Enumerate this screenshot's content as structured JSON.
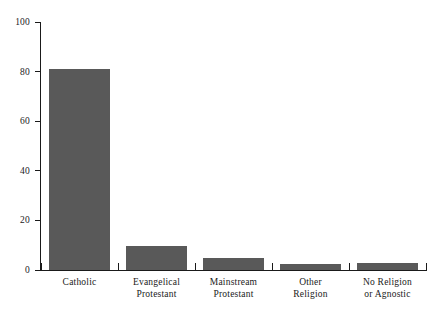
{
  "chart_data": {
    "type": "bar",
    "title": "",
    "subtitle": "",
    "xlabel": "",
    "ylabel": "",
    "ylim": [
      0,
      100
    ],
    "yticks": [
      0,
      20,
      40,
      60,
      80,
      100
    ],
    "grid": false,
    "legend": null,
    "bar_color": "#595959",
    "axis_color": "#1a1a1a",
    "background": "#ffffff",
    "categories": [
      "Catholic",
      "Evangelical Protestant",
      "Mainstream Protestant",
      "Other Religion",
      "No Religion or Agnostic"
    ],
    "category_lines": [
      [
        "Catholic",
        ""
      ],
      [
        "Evangelical",
        "Protestant"
      ],
      [
        "Mainstream",
        "Protestant"
      ],
      [
        "Other",
        "Religion"
      ],
      [
        "No Religion",
        "or Agnostic"
      ]
    ],
    "values": [
      81,
      9.5,
      5,
      2.5,
      3
    ]
  }
}
